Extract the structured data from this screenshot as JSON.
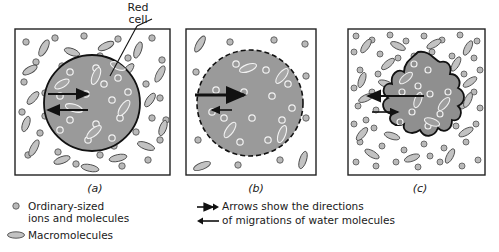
{
  "figure": {
    "title_annotation": {
      "line1": "Red",
      "line2": "cell"
    },
    "panels": [
      {
        "id": "a",
        "caption": "(a)",
        "cell_shape": "circle",
        "border": "solid",
        "tonicity": "isotonic",
        "exterior_density": "medium",
        "arrow_in_length": "medium",
        "arrow_out_length": "medium"
      },
      {
        "id": "b",
        "caption": "(b)",
        "cell_shape": "circle-swollen",
        "border": "dashed",
        "tonicity": "hypotonic",
        "exterior_density": "sparse",
        "arrow_in_length": "long",
        "arrow_out_length": "short"
      },
      {
        "id": "c",
        "caption": "(c)",
        "cell_shape": "crenated-blob",
        "border": "solid",
        "tonicity": "hypertonic",
        "exterior_density": "dense",
        "arrow_in_length": "short",
        "arrow_out_length": "long"
      }
    ]
  },
  "legend": {
    "left": [
      {
        "symbol": "small-circle",
        "line1": "Ordinary-sized",
        "line2": "ions and molecules"
      },
      {
        "symbol": "ellipse",
        "line1": "Macromolecules",
        "line2": ""
      }
    ],
    "right": {
      "symbol_top": "arrow-right",
      "symbol_bottom": "arrow-left",
      "line1": "Arrows show the directions",
      "line2": "of migrations of water molecules"
    }
  },
  "colors": {
    "cell_fill": "#9a9a9a",
    "particle_fill": "#b9b9b9",
    "particle_stroke": "#555555",
    "panel_stroke": "#222222",
    "background": "#ffffff",
    "text": "#1a1a1a"
  }
}
